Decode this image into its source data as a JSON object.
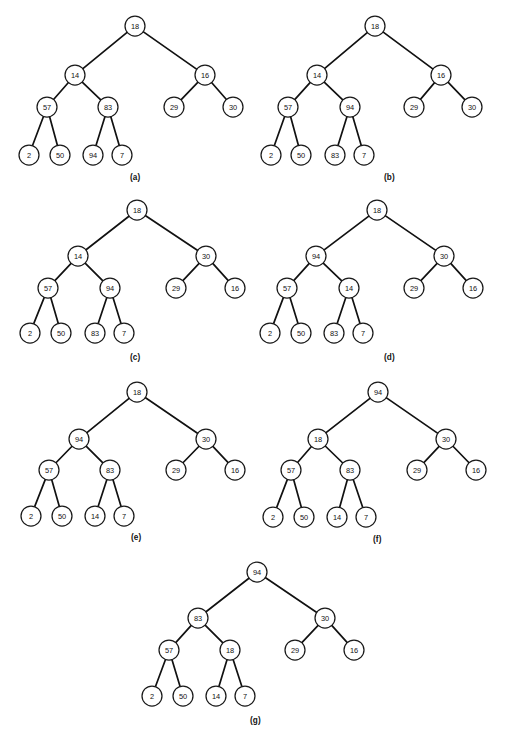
{
  "figure": {
    "title": "",
    "background_color": "#ffffff",
    "node_fill_color": "#ffffff",
    "node_stroke_color": "#1a1a1a",
    "edge_color": "#111111",
    "node_radius": 10,
    "panels": [
      {
        "caption": "(a)",
        "caption_x": 130,
        "caption_y": 173,
        "origin_x": 0,
        "origin_y": 0,
        "nodes": [
          {
            "id": "r",
            "value": "18",
            "x": 135,
            "y": 26
          },
          {
            "id": "l",
            "value": "14",
            "x": 75,
            "y": 75
          },
          {
            "id": "rr",
            "value": "16",
            "x": 205,
            "y": 75
          },
          {
            "id": "ll",
            "value": "57",
            "x": 47,
            "y": 107
          },
          {
            "id": "lr",
            "value": "83",
            "x": 108,
            "y": 107
          },
          {
            "id": "rrl",
            "value": "29",
            "x": 174,
            "y": 107
          },
          {
            "id": "rrr",
            "value": "30",
            "x": 233,
            "y": 107
          },
          {
            "id": "lll",
            "value": "2",
            "x": 29,
            "y": 155
          },
          {
            "id": "llr",
            "value": "50",
            "x": 60,
            "y": 155
          },
          {
            "id": "lrl",
            "value": "94",
            "x": 93,
            "y": 155
          },
          {
            "id": "lrr",
            "value": "7",
            "x": 122,
            "y": 155
          }
        ],
        "edges": [
          [
            "r",
            "l"
          ],
          [
            "r",
            "rr"
          ],
          [
            "l",
            "ll"
          ],
          [
            "l",
            "lr"
          ],
          [
            "rr",
            "rrl"
          ],
          [
            "rr",
            "rrr"
          ],
          [
            "ll",
            "lll"
          ],
          [
            "ll",
            "llr"
          ],
          [
            "lr",
            "lrl"
          ],
          [
            "lr",
            "lrr"
          ]
        ]
      },
      {
        "caption": "(b)",
        "caption_x": 384,
        "caption_y": 173,
        "origin_x": 254,
        "origin_y": 0,
        "nodes": [
          {
            "id": "r",
            "value": "18",
            "x": 375,
            "y": 26
          },
          {
            "id": "l",
            "value": "14",
            "x": 317,
            "y": 75
          },
          {
            "id": "rr",
            "value": "16",
            "x": 441,
            "y": 75
          },
          {
            "id": "ll",
            "value": "57",
            "x": 288,
            "y": 107
          },
          {
            "id": "lr",
            "value": "94",
            "x": 350,
            "y": 107
          },
          {
            "id": "rrl",
            "value": "29",
            "x": 414,
            "y": 107
          },
          {
            "id": "rrr",
            "value": "30",
            "x": 472,
            "y": 107
          },
          {
            "id": "lll",
            "value": "2",
            "x": 271,
            "y": 155
          },
          {
            "id": "llr",
            "value": "50",
            "x": 301,
            "y": 155
          },
          {
            "id": "lrl",
            "value": "83",
            "x": 335,
            "y": 155
          },
          {
            "id": "lrr",
            "value": "7",
            "x": 364,
            "y": 155
          }
        ],
        "edges": [
          [
            "r",
            "l"
          ],
          [
            "r",
            "rr"
          ],
          [
            "l",
            "ll"
          ],
          [
            "l",
            "lr"
          ],
          [
            "rr",
            "rrl"
          ],
          [
            "rr",
            "rrr"
          ],
          [
            "ll",
            "lll"
          ],
          [
            "ll",
            "llr"
          ],
          [
            "lr",
            "lrl"
          ],
          [
            "lr",
            "lrr"
          ]
        ]
      },
      {
        "caption": "(c)",
        "caption_x": 130,
        "caption_y": 353,
        "origin_x": 0,
        "origin_y": 182,
        "nodes": [
          {
            "id": "r",
            "value": "18",
            "x": 137,
            "y": 210
          },
          {
            "id": "l",
            "value": "14",
            "x": 78,
            "y": 256
          },
          {
            "id": "rr",
            "value": "30",
            "x": 206,
            "y": 256
          },
          {
            "id": "ll",
            "value": "57",
            "x": 48,
            "y": 288
          },
          {
            "id": "lr",
            "value": "94",
            "x": 110,
            "y": 288
          },
          {
            "id": "rrl",
            "value": "29",
            "x": 176,
            "y": 288
          },
          {
            "id": "rrr",
            "value": "16",
            "x": 235,
            "y": 288
          },
          {
            "id": "lll",
            "value": "2",
            "x": 30,
            "y": 333
          },
          {
            "id": "llr",
            "value": "50",
            "x": 61,
            "y": 333
          },
          {
            "id": "lrl",
            "value": "83",
            "x": 95,
            "y": 333
          },
          {
            "id": "lrr",
            "value": "7",
            "x": 124,
            "y": 333
          }
        ],
        "edges": [
          [
            "r",
            "l"
          ],
          [
            "r",
            "rr"
          ],
          [
            "l",
            "ll"
          ],
          [
            "l",
            "lr"
          ],
          [
            "rr",
            "rrl"
          ],
          [
            "rr",
            "rrr"
          ],
          [
            "ll",
            "lll"
          ],
          [
            "ll",
            "llr"
          ],
          [
            "lr",
            "lrl"
          ],
          [
            "lr",
            "lrr"
          ]
        ]
      },
      {
        "caption": "(d)",
        "caption_x": 384,
        "caption_y": 353,
        "origin_x": 254,
        "origin_y": 182,
        "nodes": [
          {
            "id": "r",
            "value": "18",
            "x": 377,
            "y": 210
          },
          {
            "id": "l",
            "value": "94",
            "x": 316,
            "y": 256
          },
          {
            "id": "rr",
            "value": "30",
            "x": 444,
            "y": 256
          },
          {
            "id": "ll",
            "value": "57",
            "x": 287,
            "y": 288
          },
          {
            "id": "lr",
            "value": "14",
            "x": 349,
            "y": 288
          },
          {
            "id": "rrl",
            "value": "29",
            "x": 414,
            "y": 288
          },
          {
            "id": "rrr",
            "value": "16",
            "x": 473,
            "y": 288
          },
          {
            "id": "lll",
            "value": "2",
            "x": 270,
            "y": 333
          },
          {
            "id": "llr",
            "value": "50",
            "x": 301,
            "y": 333
          },
          {
            "id": "lrl",
            "value": "83",
            "x": 334,
            "y": 333
          },
          {
            "id": "lrr",
            "value": "7",
            "x": 363,
            "y": 333
          }
        ],
        "edges": [
          [
            "r",
            "l"
          ],
          [
            "r",
            "rr"
          ],
          [
            "l",
            "ll"
          ],
          [
            "l",
            "lr"
          ],
          [
            "rr",
            "rrl"
          ],
          [
            "rr",
            "rrr"
          ],
          [
            "ll",
            "lll"
          ],
          [
            "ll",
            "llr"
          ],
          [
            "lr",
            "lrl"
          ],
          [
            "lr",
            "lrr"
          ]
        ]
      },
      {
        "caption": "(e)",
        "caption_x": 131,
        "caption_y": 533,
        "origin_x": 0,
        "origin_y": 362,
        "nodes": [
          {
            "id": "r",
            "value": "18",
            "x": 137,
            "y": 392
          },
          {
            "id": "l",
            "value": "94",
            "x": 79,
            "y": 439
          },
          {
            "id": "rr",
            "value": "30",
            "x": 206,
            "y": 439
          },
          {
            "id": "ll",
            "value": "57",
            "x": 49,
            "y": 470
          },
          {
            "id": "lr",
            "value": "83",
            "x": 110,
            "y": 470
          },
          {
            "id": "rrl",
            "value": "29",
            "x": 176,
            "y": 470
          },
          {
            "id": "rrr",
            "value": "16",
            "x": 235,
            "y": 470
          },
          {
            "id": "lll",
            "value": "2",
            "x": 31,
            "y": 516
          },
          {
            "id": "llr",
            "value": "50",
            "x": 62,
            "y": 516
          },
          {
            "id": "lrl",
            "value": "14",
            "x": 95,
            "y": 516
          },
          {
            "id": "lrr",
            "value": "7",
            "x": 124,
            "y": 516
          }
        ],
        "edges": [
          [
            "r",
            "l"
          ],
          [
            "r",
            "rr"
          ],
          [
            "l",
            "ll"
          ],
          [
            "l",
            "lr"
          ],
          [
            "rr",
            "rrl"
          ],
          [
            "rr",
            "rrr"
          ],
          [
            "ll",
            "lll"
          ],
          [
            "ll",
            "llr"
          ],
          [
            "lr",
            "lrl"
          ],
          [
            "lr",
            "lrr"
          ]
        ]
      },
      {
        "caption": "(f)",
        "caption_x": 373,
        "caption_y": 535,
        "origin_x": 254,
        "origin_y": 362,
        "nodes": [
          {
            "id": "r",
            "value": "94",
            "x": 378,
            "y": 392
          },
          {
            "id": "l",
            "value": "18",
            "x": 318,
            "y": 439
          },
          {
            "id": "rr",
            "value": "30",
            "x": 446,
            "y": 439
          },
          {
            "id": "ll",
            "value": "57",
            "x": 291,
            "y": 470
          },
          {
            "id": "lr",
            "value": "83",
            "x": 350,
            "y": 470
          },
          {
            "id": "rrl",
            "value": "29",
            "x": 417,
            "y": 470
          },
          {
            "id": "rrr",
            "value": "16",
            "x": 476,
            "y": 470
          },
          {
            "id": "lll",
            "value": "2",
            "x": 273,
            "y": 517
          },
          {
            "id": "llr",
            "value": "50",
            "x": 304,
            "y": 517
          },
          {
            "id": "lrl",
            "value": "14",
            "x": 337,
            "y": 517
          },
          {
            "id": "lrr",
            "value": "7",
            "x": 366,
            "y": 517
          }
        ],
        "edges": [
          [
            "r",
            "l"
          ],
          [
            "r",
            "rr"
          ],
          [
            "l",
            "ll"
          ],
          [
            "l",
            "lr"
          ],
          [
            "rr",
            "rrl"
          ],
          [
            "rr",
            "rrr"
          ],
          [
            "ll",
            "lll"
          ],
          [
            "ll",
            "llr"
          ],
          [
            "lr",
            "lrl"
          ],
          [
            "lr",
            "lrr"
          ]
        ]
      },
      {
        "caption": "(g)",
        "caption_x": 250,
        "caption_y": 716,
        "origin_x": 127,
        "origin_y": 545,
        "nodes": [
          {
            "id": "r",
            "value": "94",
            "x": 257,
            "y": 572
          },
          {
            "id": "l",
            "value": "83",
            "x": 198,
            "y": 618
          },
          {
            "id": "rr",
            "value": "30",
            "x": 325,
            "y": 618
          },
          {
            "id": "ll",
            "value": "57",
            "x": 169,
            "y": 650
          },
          {
            "id": "lr",
            "value": "18",
            "x": 230,
            "y": 650
          },
          {
            "id": "rrl",
            "value": "29",
            "x": 295,
            "y": 650
          },
          {
            "id": "rrr",
            "value": "16",
            "x": 354,
            "y": 650
          },
          {
            "id": "lll",
            "value": "2",
            "x": 152,
            "y": 696
          },
          {
            "id": "llr",
            "value": "50",
            "x": 183,
            "y": 696
          },
          {
            "id": "lrl",
            "value": "14",
            "x": 216,
            "y": 696
          },
          {
            "id": "lrr",
            "value": "7",
            "x": 245,
            "y": 696
          }
        ],
        "edges": [
          [
            "r",
            "l"
          ],
          [
            "r",
            "rr"
          ],
          [
            "l",
            "ll"
          ],
          [
            "l",
            "lr"
          ],
          [
            "rr",
            "rrl"
          ],
          [
            "rr",
            "rrr"
          ],
          [
            "ll",
            "lll"
          ],
          [
            "ll",
            "llr"
          ],
          [
            "lr",
            "lrl"
          ],
          [
            "lr",
            "lrr"
          ]
        ]
      }
    ]
  }
}
